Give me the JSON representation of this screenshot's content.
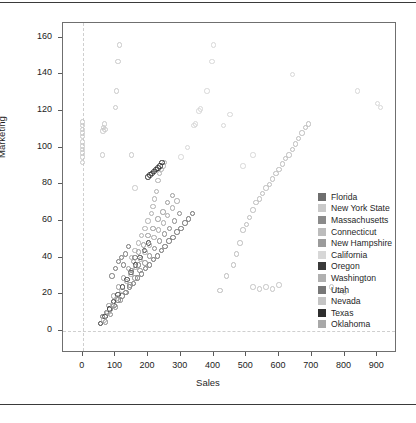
{
  "page": {
    "rule_top_label": "page-rule-top",
    "rule_bottom_label": "page-rule-bottom"
  },
  "chart_data": {
    "type": "scatter",
    "title": "",
    "xlabel": "Sales",
    "ylabel": "Marketing",
    "xlim": [
      -60,
      960
    ],
    "ylim": [
      -12,
      168
    ],
    "xticks": [
      0,
      100,
      200,
      300,
      400,
      500,
      600,
      700,
      800,
      900
    ],
    "yticks": [
      0,
      20,
      40,
      60,
      80,
      100,
      120,
      140,
      160
    ],
    "grid": false,
    "reference_lines": {
      "x": 0,
      "y": 0,
      "style": "dashed",
      "color": "#cfcfcf"
    },
    "legend_position": "right-inside",
    "marker": {
      "shape": "circle-open",
      "size": 5.4
    },
    "series": [
      {
        "name": "Florida",
        "color": "#6e6e6e",
        "points": [
          [
            60,
            8
          ],
          [
            72,
            10
          ],
          [
            84,
            12
          ],
          [
            96,
            14
          ],
          [
            108,
            17
          ],
          [
            120,
            19
          ],
          [
            132,
            21
          ],
          [
            144,
            24
          ],
          [
            156,
            26
          ],
          [
            168,
            29
          ],
          [
            180,
            31
          ],
          [
            192,
            34
          ],
          [
            204,
            36
          ],
          [
            216,
            39
          ],
          [
            228,
            41
          ],
          [
            240,
            44
          ],
          [
            252,
            46
          ],
          [
            264,
            49
          ],
          [
            276,
            51
          ],
          [
            288,
            54
          ],
          [
            300,
            56
          ],
          [
            312,
            59
          ],
          [
            324,
            61
          ],
          [
            336,
            64
          ]
        ]
      },
      {
        "name": "New York State",
        "color": "#c9c9c9",
        "points": [
          [
            0,
            92
          ],
          [
            0,
            95
          ],
          [
            0,
            97
          ],
          [
            0,
            99
          ],
          [
            0,
            101
          ],
          [
            0,
            103
          ],
          [
            0,
            106
          ],
          [
            0,
            108
          ],
          [
            0,
            110
          ],
          [
            0,
            112
          ],
          [
            0,
            114
          ],
          [
            60,
            96
          ],
          [
            62,
            109
          ],
          [
            64,
            111
          ],
          [
            66,
            113
          ],
          [
            68,
            110
          ],
          [
            100,
            122
          ],
          [
            104,
            131
          ],
          [
            108,
            147
          ],
          [
            112,
            156
          ],
          [
            150,
            96
          ],
          [
            160,
            78
          ]
        ]
      },
      {
        "name": "Massachusetts",
        "color": "#8a8a8a",
        "points": [
          [
            70,
            5
          ],
          [
            85,
            9
          ],
          [
            100,
            13
          ],
          [
            115,
            17
          ],
          [
            130,
            21
          ],
          [
            145,
            25
          ],
          [
            160,
            29
          ],
          [
            175,
            33
          ],
          [
            190,
            37
          ],
          [
            205,
            41
          ],
          [
            220,
            45
          ],
          [
            235,
            49
          ],
          [
            250,
            53
          ],
          [
            265,
            56
          ],
          [
            280,
            60
          ],
          [
            295,
            64
          ]
        ]
      },
      {
        "name": "Connecticut",
        "color": "#bcbcbc",
        "points": [
          [
            420,
            22
          ],
          [
            440,
            30
          ],
          [
            460,
            36
          ],
          [
            470,
            42
          ],
          [
            480,
            48
          ],
          [
            490,
            55
          ],
          [
            500,
            58
          ],
          [
            510,
            62
          ],
          [
            520,
            66
          ],
          [
            530,
            70
          ],
          [
            540,
            72
          ],
          [
            550,
            75
          ],
          [
            560,
            78
          ],
          [
            570,
            80
          ],
          [
            580,
            83
          ],
          [
            590,
            86
          ],
          [
            600,
            88
          ],
          [
            610,
            91
          ],
          [
            620,
            94
          ],
          [
            630,
            96
          ],
          [
            640,
            99
          ],
          [
            650,
            102
          ],
          [
            660,
            105
          ],
          [
            670,
            108
          ],
          [
            680,
            111
          ],
          [
            690,
            113
          ]
        ]
      },
      {
        "name": "New Hampshire",
        "color": "#9b9b9b",
        "points": [
          [
            80,
            14
          ],
          [
            95,
            19
          ],
          [
            110,
            24
          ],
          [
            125,
            29
          ],
          [
            140,
            34
          ],
          [
            155,
            38
          ],
          [
            170,
            43
          ],
          [
            185,
            47
          ],
          [
            200,
            52
          ],
          [
            215,
            56
          ],
          [
            230,
            61
          ],
          [
            245,
            65
          ],
          [
            260,
            70
          ],
          [
            275,
            74
          ]
        ]
      },
      {
        "name": "California",
        "color": "#d7d7d7",
        "points": [
          [
            300,
            95
          ],
          [
            320,
            100
          ],
          [
            340,
            112
          ],
          [
            345,
            113
          ],
          [
            355,
            120
          ],
          [
            360,
            121
          ],
          [
            380,
            131
          ],
          [
            395,
            147
          ],
          [
            400,
            156
          ],
          [
            430,
            112
          ],
          [
            450,
            118
          ],
          [
            490,
            90
          ],
          [
            520,
            96
          ],
          [
            640,
            140
          ],
          [
            840,
            131
          ],
          [
            900,
            124
          ],
          [
            910,
            122
          ]
        ]
      },
      {
        "name": "Oregon",
        "color": "#3a3a3a",
        "points": [
          [
            55,
            4
          ],
          [
            68,
            8
          ],
          [
            82,
            12
          ],
          [
            95,
            16
          ],
          [
            108,
            20
          ],
          [
            122,
            24
          ],
          [
            135,
            28
          ],
          [
            148,
            32
          ],
          [
            162,
            36
          ],
          [
            175,
            40
          ],
          [
            188,
            44
          ],
          [
            202,
            48
          ]
        ]
      },
      {
        "name": "Washington",
        "color": "#b0b0b0",
        "points": [
          [
            150,
            40
          ],
          [
            160,
            44
          ],
          [
            170,
            48
          ],
          [
            180,
            52
          ],
          [
            190,
            56
          ],
          [
            200,
            60
          ],
          [
            210,
            64
          ],
          [
            215,
            68
          ],
          [
            220,
            72
          ],
          [
            225,
            76
          ],
          [
            230,
            82
          ],
          [
            235,
            86
          ],
          [
            240,
            88
          ],
          [
            245,
            90
          ],
          [
            250,
            92
          ]
        ]
      },
      {
        "name": "Utah",
        "color": "#777777",
        "points": [
          [
            90,
            30
          ],
          [
            100,
            34
          ],
          [
            110,
            38
          ],
          [
            118,
            40
          ],
          [
            125,
            36
          ],
          [
            130,
            42
          ],
          [
            140,
            46
          ],
          [
            150,
            33
          ],
          [
            160,
            40
          ],
          [
            170,
            36
          ]
        ]
      },
      {
        "name": "Nevada",
        "color": "#c4c4c4",
        "points": [
          [
            520,
            24
          ],
          [
            540,
            23
          ],
          [
            560,
            24
          ],
          [
            580,
            23
          ],
          [
            600,
            25
          ],
          [
            760,
            24
          ],
          [
            780,
            22
          ],
          [
            800,
            21
          ]
        ]
      },
      {
        "name": "Texas",
        "color": "#2e2e2e",
        "points": [
          [
            200,
            84
          ],
          [
            206,
            85
          ],
          [
            212,
            86
          ],
          [
            218,
            87
          ],
          [
            224,
            88
          ],
          [
            230,
            89
          ],
          [
            236,
            90
          ],
          [
            242,
            92
          ]
        ]
      },
      {
        "name": "Oklahoma",
        "color": "#a8a8a8",
        "points": [
          [
            65,
            6
          ],
          [
            78,
            10
          ],
          [
            92,
            14
          ],
          [
            106,
            18
          ],
          [
            120,
            22
          ],
          [
            134,
            27
          ],
          [
            148,
            31
          ],
          [
            162,
            35
          ],
          [
            176,
            39
          ],
          [
            190,
            43
          ],
          [
            204,
            47
          ],
          [
            218,
            51
          ],
          [
            232,
            55
          ],
          [
            246,
            59
          ],
          [
            260,
            63
          ],
          [
            274,
            67
          ],
          [
            288,
            71
          ]
        ]
      }
    ]
  }
}
